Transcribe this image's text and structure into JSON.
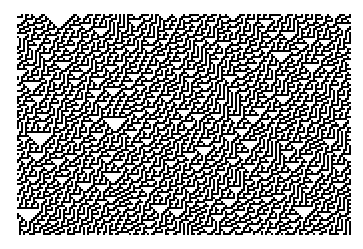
{
  "canvas": {
    "width": 363,
    "height": 249,
    "background": "#ffffff"
  },
  "figure": {
    "type": "cellular-automaton-raster",
    "plot_area": {
      "x": 17,
      "y": 14,
      "width": 334,
      "height": 221
    },
    "cell_size_px": 2,
    "columns": 167,
    "rows": 110,
    "rule": 30,
    "alive_color": "#000000",
    "dead_color": "#ffffff",
    "seed": 20240517,
    "initial_density": 0.5,
    "boundary": "periodic",
    "orientation": "time-downward",
    "visual_features": [
      "diagonal stripes rising to the right",
      "dense black triangular regions on the left and lower-left",
      "fine white diagonal streaks on the right",
      "noisy quasi-random top rows"
    ]
  }
}
